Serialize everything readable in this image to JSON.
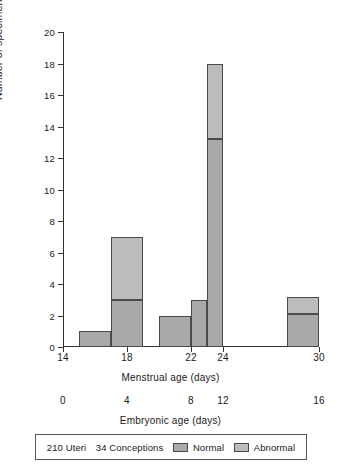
{
  "chart_data": {
    "type": "bar",
    "title": "",
    "subtitle": "",
    "ylabel": "Number of specimens recovered",
    "ylim": [
      0,
      20
    ],
    "ytick_step": 2,
    "yticks": [
      0,
      2,
      4,
      6,
      8,
      10,
      12,
      14,
      16,
      18,
      20
    ],
    "grid": false,
    "stacked": true,
    "legend_position": "bottom",
    "xlabel": "Menstrual age (days)",
    "xlabel_secondary": "Embryonic age (days)",
    "xlim": [
      14,
      30
    ],
    "xticks": [
      14,
      18,
      22,
      24,
      30
    ],
    "xticks_secondary": [
      0,
      4,
      8,
      12,
      16
    ],
    "xtick_labels": [
      "14",
      "18",
      "22",
      "24",
      "30"
    ],
    "xtick_labels_secondary": [
      "0",
      "4",
      "8",
      "12",
      "16"
    ],
    "series": [
      {
        "name": "Normal",
        "color": "#a9a9a9",
        "values": [
          1,
          3,
          2,
          3,
          13.2,
          2.1
        ]
      },
      {
        "name": "Abnormal",
        "color": "#bcbcbc",
        "values": [
          0,
          4,
          0,
          0,
          4.8,
          1.1
        ]
      }
    ],
    "bins": [
      {
        "label": "15-17",
        "x_start": 15,
        "x_end": 17,
        "normal": 1,
        "abnormal": 0,
        "total": 1
      },
      {
        "label": "17-19",
        "x_start": 17,
        "x_end": 19,
        "normal": 3,
        "abnormal": 4,
        "total": 7
      },
      {
        "label": "20-22",
        "x_start": 20,
        "x_end": 22,
        "normal": 2,
        "abnormal": 0,
        "total": 2
      },
      {
        "label": "22-23",
        "x_start": 22,
        "x_end": 23,
        "normal": 3,
        "abnormal": 0,
        "total": 3
      },
      {
        "label": "23-24",
        "x_start": 23,
        "x_end": 24,
        "normal": 13.2,
        "abnormal": 4.8,
        "total": 18
      },
      {
        "label": "28-30",
        "x_start": 28,
        "x_end": 30,
        "normal": 2.1,
        "abnormal": 1.1,
        "total": 3.2
      }
    ]
  },
  "legend": {
    "uteri_count": "210 Uteri",
    "conceptions_count": "34 Conceptions",
    "entries": [
      {
        "label": "Normal",
        "color": "#a9a9a9"
      },
      {
        "label": "Abnormal",
        "color": "#bcbcbc"
      }
    ]
  }
}
